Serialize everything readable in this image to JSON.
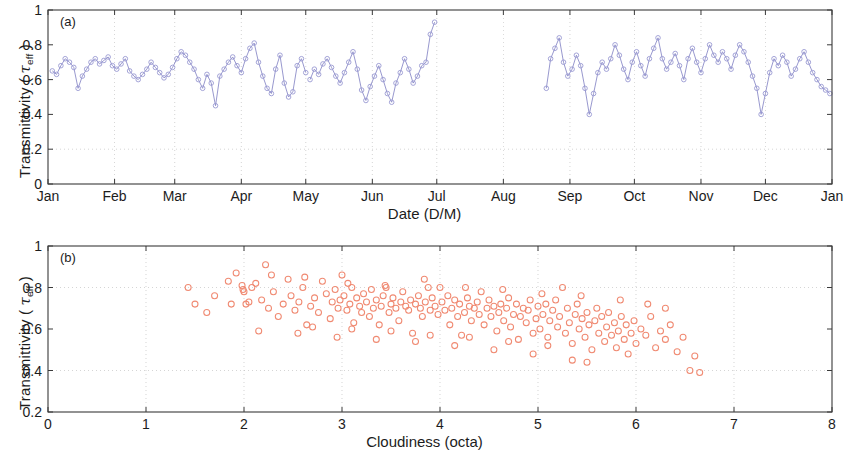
{
  "figure": {
    "background": "#ffffff",
    "line_color": "#8c8cc8",
    "marker_color": "#9a9ad2",
    "scatter_color": "#f08a72",
    "axis_color": "#3a3a3a",
    "grid_color": "#b9b9b9"
  },
  "panel_a": {
    "tag": "(a)",
    "ylabel_prefix": "Transmittivity ( ",
    "ylabel_tau": "τ",
    "ylabel_sub": "eff",
    "ylabel_suffix": " )",
    "xlabel": "Date (D/M)",
    "y_ticks": [
      "0",
      "0.2",
      "0.4",
      "0.6",
      "0.8",
      "1"
    ],
    "x_ticks": [
      "Jan",
      "Feb",
      "Mar",
      "Apr",
      "May",
      "Jun",
      "Jul",
      "Aug",
      "Sep",
      "Oct",
      "Nov",
      "Dec",
      "Jan"
    ]
  },
  "panel_b": {
    "tag": "(b)",
    "ylabel_prefix": "Transmittivity ( ",
    "ylabel_tau": "τ",
    "ylabel_sub": "eff",
    "ylabel_suffix": " )",
    "xlabel": "Cloudiness (octa)",
    "y_ticks": [
      "0.2",
      "0.4",
      "0.6",
      "0.8",
      "1"
    ],
    "x_ticks": [
      "0",
      "1",
      "2",
      "3",
      "4",
      "5",
      "6",
      "7",
      "8"
    ]
  },
  "chart_data": [
    {
      "type": "line",
      "panel": "(a)",
      "title": "",
      "xlabel": "Date (D/M)",
      "ylabel": "Transmittivity (tau_eff)",
      "xlim": [
        0,
        365
      ],
      "ylim": [
        0,
        1
      ],
      "grid": true,
      "x_tick_positions": [
        0,
        31,
        59,
        90,
        120,
        151,
        181,
        212,
        243,
        273,
        304,
        334,
        365
      ],
      "x_tick_labels": [
        "Jan",
        "Feb",
        "Mar",
        "Apr",
        "May",
        "Jun",
        "Jul",
        "Aug",
        "Sep",
        "Oct",
        "Nov",
        "Dec",
        "Jan"
      ],
      "y_tick_values": [
        0,
        0.2,
        0.4,
        0.6,
        0.8,
        1
      ],
      "marker": "open-circle",
      "series": [
        {
          "name": "segment-1-jan-to-apr",
          "x": [
            2,
            4,
            6,
            8,
            10,
            12,
            14,
            16,
            18,
            20,
            22,
            24,
            26,
            28,
            30,
            32,
            34,
            36,
            38,
            40,
            42,
            44,
            46,
            48,
            50,
            52,
            54,
            56,
            58,
            60,
            62,
            64,
            66,
            68,
            70,
            72,
            74,
            76,
            78,
            80,
            82,
            84,
            86,
            88,
            90,
            92,
            94,
            96,
            98,
            100,
            102,
            104,
            106,
            108,
            110,
            112,
            114,
            116,
            118,
            120
          ],
          "y": [
            0.65,
            0.63,
            0.68,
            0.72,
            0.7,
            0.67,
            0.55,
            0.62,
            0.66,
            0.7,
            0.72,
            0.69,
            0.71,
            0.73,
            0.68,
            0.66,
            0.69,
            0.72,
            0.65,
            0.62,
            0.6,
            0.63,
            0.66,
            0.7,
            0.67,
            0.64,
            0.61,
            0.63,
            0.67,
            0.72,
            0.76,
            0.74,
            0.7,
            0.66,
            0.6,
            0.55,
            0.63,
            0.58,
            0.45,
            0.62,
            0.66,
            0.7,
            0.73,
            0.68,
            0.64,
            0.72,
            0.78,
            0.81,
            0.7,
            0.62,
            0.55,
            0.52,
            0.66,
            0.74,
            0.58,
            0.5,
            0.53,
            0.68,
            0.72,
            0.64
          ]
        },
        {
          "name": "segment-2-jan-to-apr-cont",
          "x": [
            122,
            124,
            126,
            128,
            130,
            132,
            134,
            136,
            138,
            140,
            142,
            144,
            146,
            148,
            150,
            152,
            154,
            156,
            158,
            160,
            162,
            164,
            166,
            168,
            170,
            172,
            174,
            176,
            178,
            180
          ],
          "y": [
            0.6,
            0.66,
            0.63,
            0.69,
            0.72,
            0.67,
            0.62,
            0.58,
            0.64,
            0.7,
            0.76,
            0.66,
            0.54,
            0.48,
            0.56,
            0.62,
            0.68,
            0.6,
            0.52,
            0.47,
            0.58,
            0.64,
            0.72,
            0.66,
            0.58,
            0.62,
            0.68,
            0.7,
            0.86,
            0.93
          ]
        },
        {
          "name": "segment-3-aug-to-dec",
          "x": [
            232,
            234,
            236,
            238,
            240,
            242,
            244,
            246,
            248,
            250,
            252,
            254,
            256,
            258,
            260,
            262,
            264,
            266,
            268,
            270,
            272,
            274,
            276,
            278,
            280,
            282,
            284,
            286,
            288,
            290,
            292,
            294,
            296,
            298,
            300,
            302,
            304,
            306,
            308,
            310,
            312,
            314,
            316,
            318,
            320,
            322,
            324,
            326,
            328,
            330,
            332,
            334,
            336,
            338,
            340,
            342,
            344,
            346,
            348,
            350,
            352,
            354,
            356,
            358,
            360,
            362,
            364
          ],
          "y": [
            0.55,
            0.72,
            0.78,
            0.84,
            0.7,
            0.62,
            0.66,
            0.74,
            0.68,
            0.55,
            0.4,
            0.52,
            0.64,
            0.7,
            0.66,
            0.72,
            0.8,
            0.74,
            0.66,
            0.6,
            0.7,
            0.76,
            0.68,
            0.62,
            0.72,
            0.78,
            0.84,
            0.72,
            0.66,
            0.7,
            0.75,
            0.68,
            0.6,
            0.72,
            0.78,
            0.7,
            0.64,
            0.72,
            0.8,
            0.74,
            0.7,
            0.76,
            0.72,
            0.66,
            0.74,
            0.8,
            0.76,
            0.7,
            0.62,
            0.55,
            0.4,
            0.52,
            0.64,
            0.72,
            0.68,
            0.74,
            0.7,
            0.62,
            0.66,
            0.72,
            0.76,
            0.7,
            0.64,
            0.6,
            0.56,
            0.54,
            0.52
          ]
        }
      ]
    },
    {
      "type": "scatter",
      "panel": "(b)",
      "title": "",
      "xlabel": "Cloudiness (octa)",
      "ylabel": "Transmittivity (tau_eff)",
      "xlim": [
        0,
        8
      ],
      "ylim": [
        0.2,
        1
      ],
      "grid": true,
      "x_tick_values": [
        0,
        1,
        2,
        3,
        4,
        5,
        6,
        7,
        8
      ],
      "y_tick_values": [
        0.2,
        0.4,
        0.6,
        0.8,
        1
      ],
      "marker": "open-circle",
      "marker_color": "#f08a72",
      "points": [
        [
          1.43,
          0.8
        ],
        [
          1.62,
          0.68
        ],
        [
          1.84,
          0.83
        ],
        [
          1.87,
          0.72
        ],
        [
          1.92,
          0.87
        ],
        [
          1.98,
          0.81
        ],
        [
          1.99,
          0.79
        ],
        [
          2.0,
          0.78
        ],
        [
          2.02,
          0.72
        ],
        [
          2.05,
          0.73
        ],
        [
          2.08,
          0.8
        ],
        [
          2.12,
          0.82
        ],
        [
          2.18,
          0.74
        ],
        [
          2.22,
          0.91
        ],
        [
          2.25,
          0.7
        ],
        [
          2.3,
          0.78
        ],
        [
          2.35,
          0.66
        ],
        [
          2.4,
          0.72
        ],
        [
          2.45,
          0.84
        ],
        [
          2.48,
          0.76
        ],
        [
          2.52,
          0.69
        ],
        [
          2.56,
          0.73
        ],
        [
          2.6,
          0.8
        ],
        [
          2.64,
          0.62
        ],
        [
          2.68,
          0.71
        ],
        [
          2.72,
          0.75
        ],
        [
          2.76,
          0.68
        ],
        [
          2.8,
          0.83
        ],
        [
          2.84,
          0.77
        ],
        [
          2.88,
          0.65
        ],
        [
          2.9,
          0.73
        ],
        [
          2.93,
          0.79
        ],
        [
          2.96,
          0.7
        ],
        [
          2.98,
          0.74
        ],
        [
          3.0,
          0.86
        ],
        [
          3.02,
          0.76
        ],
        [
          3.05,
          0.69
        ],
        [
          3.08,
          0.72
        ],
        [
          3.1,
          0.8
        ],
        [
          3.12,
          0.63
        ],
        [
          3.15,
          0.75
        ],
        [
          3.18,
          0.71
        ],
        [
          3.2,
          0.68
        ],
        [
          3.22,
          0.77
        ],
        [
          3.25,
          0.73
        ],
        [
          3.28,
          0.66
        ],
        [
          3.3,
          0.79
        ],
        [
          3.32,
          0.7
        ],
        [
          3.35,
          0.74
        ],
        [
          3.38,
          0.62
        ],
        [
          3.4,
          0.71
        ],
        [
          3.42,
          0.76
        ],
        [
          3.45,
          0.8
        ],
        [
          3.48,
          0.68
        ],
        [
          3.5,
          0.72
        ],
        [
          3.52,
          0.75
        ],
        [
          3.55,
          0.7
        ],
        [
          3.58,
          0.64
        ],
        [
          3.6,
          0.73
        ],
        [
          3.62,
          0.78
        ],
        [
          3.65,
          0.71
        ],
        [
          3.68,
          0.69
        ],
        [
          3.7,
          0.74
        ],
        [
          3.72,
          0.58
        ],
        [
          3.75,
          0.72
        ],
        [
          3.78,
          0.76
        ],
        [
          3.8,
          0.7
        ],
        [
          3.82,
          0.66
        ],
        [
          3.85,
          0.73
        ],
        [
          3.88,
          0.8
        ],
        [
          3.9,
          0.69
        ],
        [
          3.92,
          0.75
        ],
        [
          3.95,
          0.71
        ],
        [
          3.98,
          0.67
        ],
        [
          4.0,
          0.8
        ],
        [
          4.02,
          0.73
        ],
        [
          4.05,
          0.69
        ],
        [
          4.08,
          0.76
        ],
        [
          4.1,
          0.62
        ],
        [
          4.12,
          0.7
        ],
        [
          4.15,
          0.74
        ],
        [
          4.18,
          0.66
        ],
        [
          4.2,
          0.72
        ],
        [
          4.22,
          0.57
        ],
        [
          4.25,
          0.68
        ],
        [
          4.28,
          0.75
        ],
        [
          4.3,
          0.71
        ],
        [
          4.32,
          0.64
        ],
        [
          4.35,
          0.7
        ],
        [
          4.38,
          0.73
        ],
        [
          4.4,
          0.67
        ],
        [
          4.42,
          0.78
        ],
        [
          4.45,
          0.62
        ],
        [
          4.48,
          0.7
        ],
        [
          4.5,
          0.74
        ],
        [
          4.52,
          0.66
        ],
        [
          4.55,
          0.71
        ],
        [
          4.58,
          0.59
        ],
        [
          4.6,
          0.68
        ],
        [
          4.62,
          0.72
        ],
        [
          4.65,
          0.64
        ],
        [
          4.68,
          0.7
        ],
        [
          4.7,
          0.75
        ],
        [
          4.72,
          0.61
        ],
        [
          4.75,
          0.67
        ],
        [
          4.78,
          0.72
        ],
        [
          4.8,
          0.55
        ],
        [
          4.82,
          0.66
        ],
        [
          4.85,
          0.7
        ],
        [
          4.88,
          0.63
        ],
        [
          4.9,
          0.69
        ],
        [
          4.92,
          0.74
        ],
        [
          4.95,
          0.58
        ],
        [
          4.98,
          0.65
        ],
        [
          5.0,
          0.71
        ],
        [
          5.02,
          0.6
        ],
        [
          5.05,
          0.67
        ],
        [
          5.08,
          0.72
        ],
        [
          5.1,
          0.56
        ],
        [
          5.12,
          0.64
        ],
        [
          5.15,
          0.69
        ],
        [
          5.18,
          0.74
        ],
        [
          5.2,
          0.61
        ],
        [
          5.22,
          0.66
        ],
        [
          5.25,
          0.8
        ],
        [
          5.28,
          0.58
        ],
        [
          5.3,
          0.7
        ],
        [
          5.32,
          0.63
        ],
        [
          5.35,
          0.53
        ],
        [
          5.38,
          0.67
        ],
        [
          5.4,
          0.72
        ],
        [
          5.42,
          0.6
        ],
        [
          5.45,
          0.65
        ],
        [
          5.48,
          0.56
        ],
        [
          5.5,
          0.68
        ],
        [
          5.52,
          0.62
        ],
        [
          5.55,
          0.5
        ],
        [
          5.58,
          0.64
        ],
        [
          5.6,
          0.7
        ],
        [
          5.62,
          0.58
        ],
        [
          5.65,
          0.66
        ],
        [
          5.68,
          0.54
        ],
        [
          5.7,
          0.61
        ],
        [
          5.72,
          0.68
        ],
        [
          5.75,
          0.57
        ],
        [
          5.78,
          0.63
        ],
        [
          5.8,
          0.51
        ],
        [
          5.82,
          0.59
        ],
        [
          5.85,
          0.66
        ],
        [
          5.88,
          0.55
        ],
        [
          5.9,
          0.62
        ],
        [
          5.92,
          0.48
        ],
        [
          5.95,
          0.58
        ],
        [
          5.98,
          0.64
        ],
        [
          6.0,
          0.53
        ],
        [
          6.05,
          0.6
        ],
        [
          6.1,
          0.57
        ],
        [
          6.15,
          0.66
        ],
        [
          6.2,
          0.51
        ],
        [
          6.25,
          0.59
        ],
        [
          6.3,
          0.55
        ],
        [
          6.35,
          0.62
        ],
        [
          6.42,
          0.49
        ],
        [
          6.48,
          0.56
        ],
        [
          6.55,
          0.4
        ],
        [
          6.6,
          0.47
        ],
        [
          6.65,
          0.39
        ],
        [
          2.15,
          0.59
        ],
        [
          2.55,
          0.58
        ],
        [
          2.95,
          0.56
        ],
        [
          3.35,
          0.55
        ],
        [
          3.75,
          0.54
        ],
        [
          4.15,
          0.52
        ],
        [
          4.55,
          0.5
        ],
        [
          4.95,
          0.48
        ],
        [
          5.35,
          0.45
        ],
        [
          2.7,
          0.61
        ],
        [
          3.1,
          0.6
        ],
        [
          3.5,
          0.59
        ],
        [
          3.9,
          0.57
        ],
        [
          4.3,
          0.56
        ],
        [
          4.7,
          0.54
        ],
        [
          5.1,
          0.52
        ],
        [
          5.5,
          0.44
        ],
        [
          1.5,
          0.72
        ],
        [
          1.7,
          0.76
        ],
        [
          2.28,
          0.86
        ],
        [
          2.62,
          0.85
        ],
        [
          3.06,
          0.82
        ],
        [
          3.44,
          0.81
        ],
        [
          3.84,
          0.84
        ],
        [
          4.26,
          0.8
        ],
        [
          4.64,
          0.79
        ],
        [
          5.04,
          0.77
        ],
        [
          5.44,
          0.76
        ],
        [
          5.84,
          0.74
        ],
        [
          6.12,
          0.72
        ],
        [
          6.3,
          0.7
        ]
      ]
    }
  ]
}
